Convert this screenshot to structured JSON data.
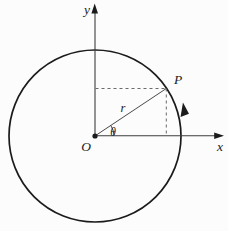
{
  "figure": {
    "labels": {
      "origin": "O",
      "x_axis": "x",
      "y_axis": "y",
      "point": "P",
      "radius": "r",
      "angle": "θ"
    },
    "colors": {
      "ink": "#1b1b1b",
      "axis": "#3c3c3c",
      "dashed": "#6a6a6a",
      "background": "#fcfcfc"
    }
  }
}
